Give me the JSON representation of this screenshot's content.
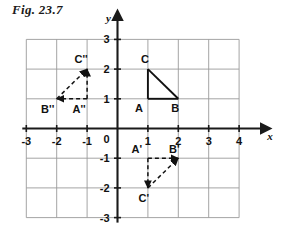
{
  "figure": {
    "title": "Fig. 23.7",
    "background_color": "#ffffff",
    "grid_color": "#9a9a9a",
    "axis_color": "#1a1a1a",
    "shape_color": "#111111"
  },
  "axes": {
    "x_name": "x",
    "y_name": "y",
    "x_ticks": [
      "-3",
      "-2",
      "-1",
      "1",
      "2",
      "3",
      "4"
    ],
    "y_ticks": [
      "3",
      "2",
      "1",
      "-1",
      "-2",
      "-3"
    ],
    "origin_label": "0",
    "x_range": [
      -3,
      4
    ],
    "y_range": [
      -3,
      3
    ],
    "grid": true
  },
  "chart_data": {
    "type": "scatter",
    "title": "Fig. 23.7",
    "xlabel": "x",
    "ylabel": "y",
    "xlim": [
      -3,
      4
    ],
    "ylim": [
      -3,
      3
    ],
    "grid": true,
    "legend": "none",
    "shapes": [
      {
        "name": "triangle-original",
        "style": "solid",
        "arrows": false,
        "points": [
          {
            "label": "A",
            "x": 1,
            "y": 1,
            "label_dx": -9,
            "label_dy": 13
          },
          {
            "label": "B",
            "x": 2,
            "y": 1,
            "label_dx": -3,
            "label_dy": 13
          },
          {
            "label": "C",
            "x": 1,
            "y": 2,
            "label_dx": -3,
            "label_dy": -6
          }
        ],
        "edges": [
          [
            "A",
            "B"
          ],
          [
            "A",
            "C"
          ],
          [
            "B",
            "C"
          ]
        ]
      },
      {
        "name": "triangle-image-prime",
        "style": "dashed",
        "arrows": true,
        "points": [
          {
            "label": "A'",
            "x": 1,
            "y": -1,
            "label_dx": -11,
            "label_dy": -5
          },
          {
            "label": "B'",
            "x": 2,
            "y": -1,
            "label_dx": -4,
            "label_dy": -5
          },
          {
            "label": "C'",
            "x": 1,
            "y": -2,
            "label_dx": -4,
            "label_dy": 14
          }
        ],
        "edges": [
          [
            "A'",
            "B'"
          ],
          [
            "A'",
            "C'"
          ],
          [
            "C'",
            "B'"
          ]
        ]
      },
      {
        "name": "triangle-image-double-prime",
        "style": "dashed",
        "arrows": true,
        "points": [
          {
            "label": "A''",
            "x": -1,
            "y": 1,
            "label_dx": -8,
            "label_dy": 14
          },
          {
            "label": "B''",
            "x": -2,
            "y": 1,
            "label_dx": -9,
            "label_dy": 14
          },
          {
            "label": "C''",
            "x": -1,
            "y": 2,
            "label_dx": -6,
            "label_dy": -6
          }
        ],
        "edges": [
          [
            "A''",
            "B''"
          ],
          [
            "A''",
            "C''"
          ],
          [
            "B''",
            "C''"
          ]
        ]
      }
    ]
  }
}
